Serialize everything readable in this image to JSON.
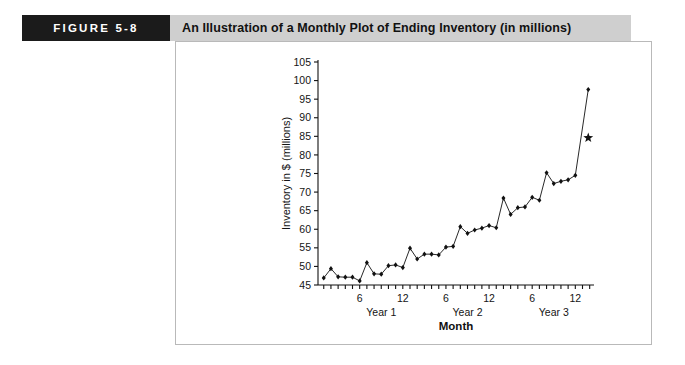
{
  "figure": {
    "number_label": "FIGURE 5-8",
    "title": "An Illustration of a Monthly Plot of Ending Inventory (in millions)",
    "number_box_color": "#1b1b1b",
    "title_box_color": "#cfcfcf",
    "number_text_color": "#ffffff",
    "title_text_color": "#111111",
    "panel_border_color": "#b9b9b9"
  },
  "chart_data": {
    "type": "line",
    "title": "",
    "xlabel": "Month",
    "ylabel": "Inventory in $ (millions)",
    "ylim": [
      45,
      105
    ],
    "ytick_step": 5,
    "yticks": [
      45,
      50,
      55,
      60,
      65,
      70,
      75,
      80,
      85,
      90,
      95,
      100,
      105
    ],
    "grid": false,
    "legend": "none",
    "marker": "filled-diamond",
    "series_color": "#111111",
    "x": [
      1,
      2,
      3,
      4,
      5,
      6,
      7,
      8,
      9,
      10,
      11,
      12,
      13,
      14,
      15,
      16,
      17,
      18,
      19,
      20,
      21,
      22,
      23,
      24,
      25,
      26,
      27,
      28,
      29,
      30,
      31,
      32,
      33,
      34,
      35,
      36
    ],
    "values": [
      46.9,
      49.4,
      47.2,
      47.1,
      47.1,
      46.1,
      51.0,
      48.0,
      47.9,
      50.2,
      50.4,
      49.7,
      54.9,
      52.0,
      53.3,
      53.3,
      53.1,
      55.2,
      55.4,
      60.7,
      58.9,
      59.8,
      60.3,
      61.0,
      60.4,
      68.4,
      64.0,
      65.8,
      66.0,
      68.6,
      67.8,
      75.2,
      72.3,
      72.9,
      73.3,
      74.5
    ],
    "forecast": {
      "label": "forecast-point",
      "x": 37.8,
      "value": 97.6,
      "marker": "filled-diamond"
    },
    "star_marker": {
      "label": "star-marker",
      "x": 37.8,
      "value": 84.6,
      "marker": "star"
    },
    "x_axis": {
      "tick_interval": 1,
      "labeled_ticks": [
        {
          "x": 6,
          "label": "6"
        },
        {
          "x": 12,
          "label": "12"
        },
        {
          "x": 18,
          "label": "6"
        },
        {
          "x": 24,
          "label": "12"
        },
        {
          "x": 30,
          "label": "6"
        },
        {
          "x": 36,
          "label": "12"
        }
      ],
      "group_labels": [
        {
          "center_x": 9,
          "label": "Year 1"
        },
        {
          "center_x": 21,
          "label": "Year 2"
        },
        {
          "center_x": 33,
          "label": "Year 3"
        }
      ]
    }
  }
}
